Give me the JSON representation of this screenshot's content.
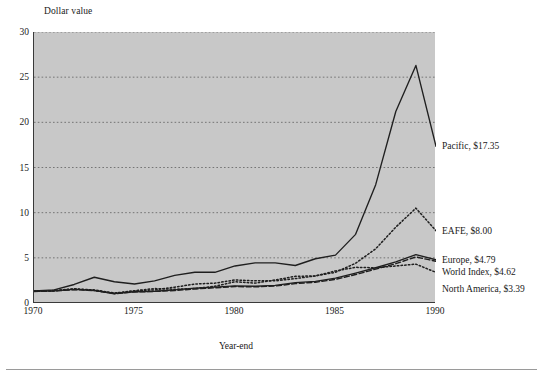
{
  "figure": {
    "y_axis_title": "Dollar value",
    "x_axis_title": "Year-end",
    "plot_background": "#c8c8c8",
    "page_background": "#ffffff",
    "axis_color": "#3a3a3a",
    "gridline_color": "#6b6b6b"
  },
  "axes": {
    "y_ticks": [
      "0",
      "5",
      "10",
      "15",
      "20",
      "25",
      "30"
    ],
    "x_ticks": [
      "1970",
      "1975",
      "1980",
      "1985",
      "1990"
    ]
  },
  "labels": [
    {
      "text": "Pacific, $17.35"
    },
    {
      "text": "EAFE, $8.00"
    },
    {
      "text": "Europe, $4.79"
    },
    {
      "text": "World Index, $4.62"
    },
    {
      "text": "North America, $3.39"
    }
  ],
  "chart_data": {
    "type": "line",
    "title": "",
    "xlabel": "Year-end",
    "ylabel": "Dollar value",
    "xlim": [
      1970,
      1990
    ],
    "ylim": [
      0,
      30
    ],
    "yticks": [
      0,
      5,
      10,
      15,
      20,
      25,
      30
    ],
    "xticks": [
      1970,
      1975,
      1980,
      1985,
      1990
    ],
    "grid": "horizontal-dotted",
    "legend_position": "inline-right",
    "x": [
      1970,
      1971,
      1972,
      1973,
      1974,
      1975,
      1976,
      1977,
      1978,
      1979,
      1980,
      1981,
      1982,
      1983,
      1984,
      1985,
      1986,
      1987,
      1988,
      1989,
      1990
    ],
    "series": [
      {
        "name": "Pacific",
        "style": "solid",
        "end_label": "Pacific, $17.35",
        "end_value": 17.35,
        "values": [
          1.35,
          1.45,
          2.05,
          2.85,
          2.35,
          2.1,
          2.45,
          3.05,
          3.4,
          3.4,
          4.1,
          4.45,
          4.45,
          4.15,
          4.9,
          5.3,
          7.6,
          13.1,
          21.2,
          26.3,
          17.35
        ]
      },
      {
        "name": "EAFE",
        "style": "dotted",
        "end_label": "EAFE, $8.00",
        "end_value": 8.0,
        "values": [
          1.3,
          1.35,
          1.55,
          1.45,
          1.1,
          1.35,
          1.45,
          1.75,
          2.1,
          2.2,
          2.55,
          2.45,
          2.45,
          2.7,
          3.0,
          3.4,
          4.4,
          6.0,
          8.4,
          10.5,
          8.0
        ]
      },
      {
        "name": "Europe",
        "style": "solid",
        "end_label": "Europe, $4.79",
        "end_value": 4.79,
        "values": [
          1.3,
          1.35,
          1.5,
          1.4,
          1.05,
          1.25,
          1.3,
          1.45,
          1.65,
          1.75,
          1.9,
          1.85,
          1.95,
          2.25,
          2.4,
          2.75,
          3.3,
          3.9,
          4.55,
          5.35,
          4.79
        ]
      },
      {
        "name": "World Index",
        "style": "dashed",
        "end_label": "World Index, $4.62",
        "end_value": 4.62,
        "values": [
          1.28,
          1.32,
          1.48,
          1.38,
          1.02,
          1.22,
          1.28,
          1.38,
          1.55,
          1.68,
          1.82,
          1.78,
          1.88,
          2.15,
          2.3,
          2.62,
          3.15,
          3.75,
          4.35,
          5.1,
          4.62
        ]
      },
      {
        "name": "North America",
        "style": "dotted",
        "end_label": "North America, $3.39",
        "end_value": 3.39,
        "values": [
          1.3,
          1.38,
          1.58,
          1.38,
          1.05,
          1.35,
          1.6,
          1.52,
          1.6,
          1.85,
          2.35,
          2.2,
          2.55,
          2.95,
          3.0,
          3.55,
          3.95,
          3.9,
          4.1,
          4.3,
          3.39
        ]
      }
    ]
  }
}
